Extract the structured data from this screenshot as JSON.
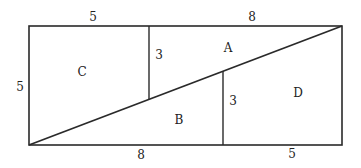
{
  "diagram": {
    "type": "geometric-dissection",
    "stroke_color": "#2a2a2a",
    "dimension_labels": {
      "top_left": "5",
      "top_right": "8",
      "left": "5",
      "upper_divider": "3",
      "lower_divider": "3",
      "bottom_left": "8",
      "bottom_right": "5"
    },
    "region_labels": {
      "a": "A",
      "b": "B",
      "c": "C",
      "d": "D"
    }
  }
}
